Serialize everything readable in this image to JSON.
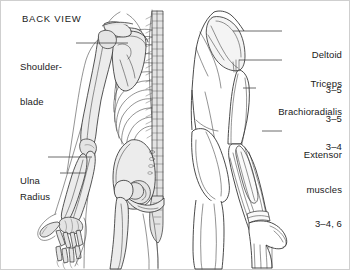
{
  "figure": {
    "title": "BACK VIEW",
    "width": 350,
    "height": 270,
    "background_color": "#ffffff",
    "line_color": "#2b2b2b",
    "leader_color": "#3c3c3c",
    "muscle_fill": "#f4f4f4",
    "bone_fill": "#ededed",
    "text_color": "#1a1a1a"
  },
  "labels": {
    "shoulder_blade": {
      "line1": "Shoulder-",
      "line2": "blade"
    },
    "ulna": {
      "line1": "Ulna"
    },
    "radius": {
      "line1": "Radius"
    },
    "deltoid": {
      "line1": "Deltoid",
      "line2": "3–5"
    },
    "triceps": {
      "line1": "Triceps",
      "line2": "3–5"
    },
    "brachioradialis": {
      "line1": "Brachioradialis",
      "line2": "3–4"
    },
    "extensor_muscles": {
      "line1": "Extensor",
      "line2": "muscles",
      "line3": "3–4, 6"
    }
  }
}
